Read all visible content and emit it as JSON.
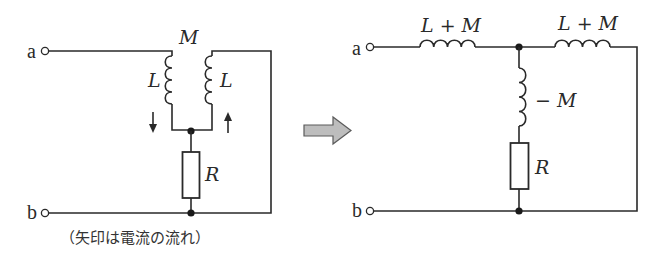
{
  "diagram": {
    "type": "circuit-equivalent-transformation",
    "left_circuit": {
      "terminals": [
        "a",
        "b"
      ],
      "mutual_label": "M",
      "coil_left_label": "L",
      "coil_right_label": "L",
      "resistor_label": "R",
      "current_arrows": [
        "down",
        "up"
      ],
      "caption": "（矢印は電流の流れ）"
    },
    "transform_arrow": "right-arrow",
    "right_circuit": {
      "terminals": [
        "a",
        "b"
      ],
      "series_coil_left_label": "L + M",
      "series_coil_right_label": "L + M",
      "shunt_coil_label": "− M",
      "resistor_label": "R"
    },
    "colors": {
      "line": "#2a2a2a",
      "arrow_fill": "#bdbdbd",
      "background": "#ffffff"
    }
  }
}
